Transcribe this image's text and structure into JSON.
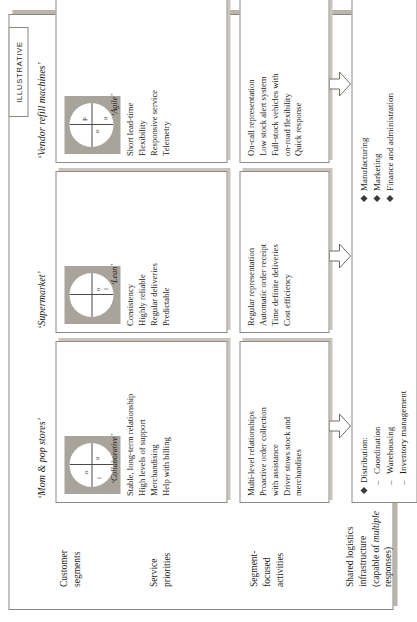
{
  "figure": {
    "tag": "ILLUSTRATIVE"
  },
  "row_labels": [
    {
      "id": "customer-segments",
      "line1": "Customer",
      "line2": "segments",
      "line3": "",
      "line4": ""
    },
    {
      "id": "service-priorities",
      "line1": "Service",
      "line2": "priorities",
      "line3": "",
      "line4": ""
    },
    {
      "id": "segment-focused-activities",
      "line1": "Segment-",
      "line2": "focused",
      "line3": "activities",
      "line4": ""
    },
    {
      "id": "shared-logistics",
      "line1": "Shared logistics",
      "line2": "infrastructure",
      "line3": "(capable of ",
      "line3_italic": "multiple",
      "line4": "responses)"
    }
  ],
  "columns": [
    {
      "id": "mom-and-pop",
      "header": "‘Mom & pop stores’",
      "circle_caption": "‘Collaborative’",
      "quadrants": {
        "top_left": "i",
        "top_right": "o",
        "bottom_left": "",
        "bottom_right": "a"
      },
      "service_priorities": [
        "Stable, long-term relationship",
        "High levels of support",
        "Merchandising",
        "Help with billing"
      ],
      "segment_activities": [
        "Multi-level relationships",
        "Proactive order collection",
        "with assistance",
        "Driver stows stock and",
        "merchandises"
      ]
    },
    {
      "id": "supermarket",
      "header": "‘Supermarket’",
      "circle_caption": "‘Lean’",
      "quadrants": {
        "top_left": "",
        "top_right": "",
        "bottom_left": "o",
        "bottom_right": "l"
      },
      "service_priorities": [
        "Consistency",
        "Highly reliable",
        "Regular deliveries",
        "Predictable"
      ],
      "segment_activities": [
        "Regular representation",
        "Automatic order receipt",
        "Time definite deliveries",
        "Cost efficiency"
      ]
    },
    {
      "id": "vendor-refill-machines",
      "header": "‘Vendor refill machines’",
      "circle_caption": "‘Agile’",
      "quadrants": {
        "top_left": "",
        "top_right": "P",
        "bottom_left": "o",
        "bottom_right": "a"
      },
      "service_priorities": [
        "Short lead-time",
        "Flexibility",
        "Responsive service",
        "Telemetry"
      ],
      "segment_activities": [
        "On-call representation",
        "Low stock alert system",
        "Full-stock vehicles with",
        "on-road flexibility",
        "Quick response"
      ]
    }
  ],
  "shared_logistics": {
    "groups": [
      {
        "bullet": "Distribution:",
        "subitems": [
          "Coordination",
          "Warehousing",
          "Inventory management"
        ]
      },
      {
        "bullet": "Manufacturing",
        "subitems": []
      },
      {
        "bullet": "Marketing",
        "subitems": []
      },
      {
        "bullet": "Finance and administration",
        "subitems": []
      }
    ]
  },
  "colors": {
    "panel": "#a8a49c",
    "border": "#8d8a83",
    "shadow": "#c9c5bd",
    "text": "#1c1c1c"
  }
}
